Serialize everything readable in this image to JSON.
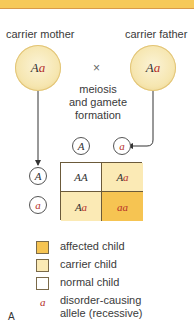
{
  "diagram": {
    "title_bar_color": "#f6c95a",
    "parents": {
      "mother": {
        "label": "carrier mother",
        "genotype_dom": "A",
        "genotype_rec": "a"
      },
      "father": {
        "label": "carrier father",
        "genotype_dom": "A",
        "genotype_rec": "a"
      },
      "cross_symbol": "×"
    },
    "process": {
      "line1": "meiosis",
      "line2": "and gamete",
      "line3": "formation"
    },
    "gametes": {
      "father": [
        {
          "allele": "A",
          "recessive": false
        },
        {
          "allele": "a",
          "recessive": true
        }
      ],
      "mother": [
        {
          "allele": "A",
          "recessive": false
        },
        {
          "allele": "a",
          "recessive": true
        }
      ]
    },
    "punnett": {
      "cells": [
        {
          "dom": "AA",
          "rec": "",
          "type": "normal",
          "color": "#ffffff"
        },
        {
          "dom": "A",
          "rec": "a",
          "type": "carrier",
          "color": "#fbeab5"
        },
        {
          "dom": "A",
          "rec": "a",
          "type": "carrier",
          "color": "#fbeab5"
        },
        {
          "dom": "",
          "rec": "aa",
          "type": "affected",
          "color": "#f6c452"
        }
      ]
    },
    "legend": {
      "affected": {
        "label": "affected child",
        "color": "#f6c452"
      },
      "carrier": {
        "label": "carrier child",
        "color": "#fbeab5"
      },
      "normal": {
        "label": "normal child",
        "color": "#ffffff"
      },
      "allele": {
        "symbol": "a",
        "line1": "disorder-causing",
        "line2": "allele (recessive)"
      }
    },
    "panel_letter": "A"
  }
}
